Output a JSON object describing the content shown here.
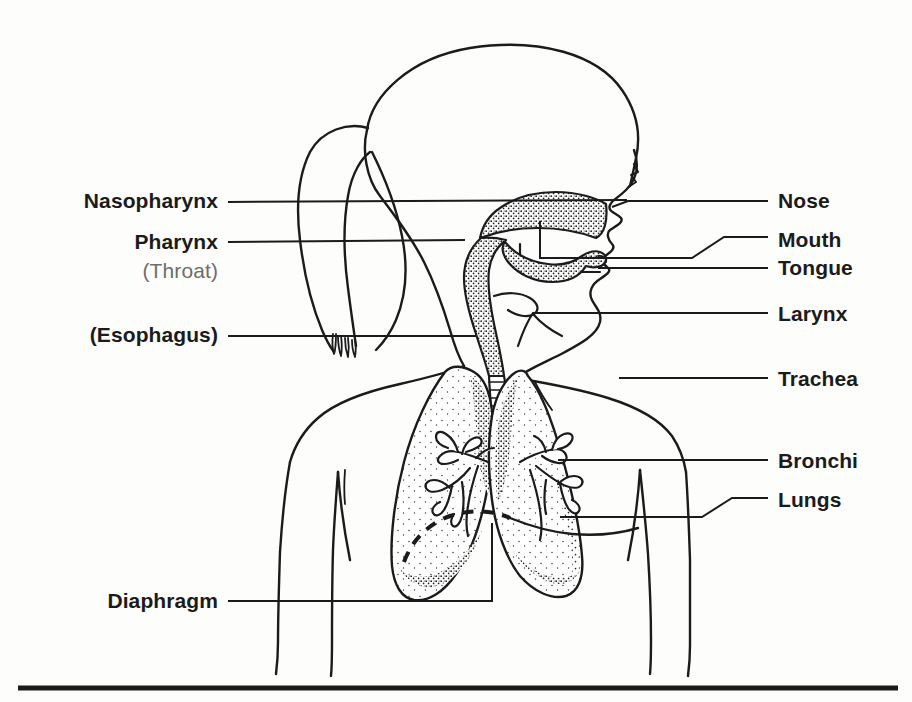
{
  "figure": {
    "ink_color": "#1b1b1b",
    "background_color": "#fdfdfc",
    "sub_label_color": "#6d6d6d",
    "rule_color": "#1b1b1b"
  },
  "labels": {
    "left": [
      {
        "id": "nasopharynx",
        "text": "Nasopharynx",
        "x": 218,
        "y": 202,
        "align": "right",
        "style": "bold"
      },
      {
        "id": "pharynx",
        "text": "Pharynx",
        "x": 218,
        "y": 243,
        "align": "right",
        "style": "bold"
      },
      {
        "id": "throat",
        "text": "(Throat)",
        "x": 218,
        "y": 272,
        "align": "right",
        "style": "regular"
      },
      {
        "id": "esophagus",
        "text": "(Esophagus)",
        "x": 218,
        "y": 336,
        "align": "right",
        "style": "bold"
      },
      {
        "id": "diaphragm",
        "text": "Diaphragm",
        "x": 218,
        "y": 602,
        "align": "right",
        "style": "bold"
      }
    ],
    "right": [
      {
        "id": "nose",
        "text": "Nose",
        "x": 778,
        "y": 202,
        "align": "left",
        "style": "bold"
      },
      {
        "id": "mouth",
        "text": "Mouth",
        "x": 778,
        "y": 241,
        "align": "left",
        "style": "bold"
      },
      {
        "id": "tongue",
        "text": "Tongue",
        "x": 778,
        "y": 269,
        "align": "left",
        "style": "bold"
      },
      {
        "id": "larynx",
        "text": "Larynx",
        "x": 778,
        "y": 315,
        "align": "left",
        "style": "bold"
      },
      {
        "id": "trachea",
        "text": "Trachea",
        "x": 778,
        "y": 380,
        "align": "left",
        "style": "bold"
      },
      {
        "id": "bronchi",
        "text": "Bronchi",
        "x": 778,
        "y": 462,
        "align": "left",
        "style": "bold"
      },
      {
        "id": "lungs",
        "text": "Lungs",
        "x": 778,
        "y": 501,
        "align": "left",
        "style": "bold"
      }
    ]
  },
  "leaders": [
    {
      "id": "leader-nasopharynx",
      "from": "nasopharynx",
      "path": "M228,202 L627,200"
    },
    {
      "id": "leader-pharynx",
      "from": "pharynx",
      "path": "M228,242 L465,240"
    },
    {
      "id": "leader-esophagus",
      "from": "esophagus",
      "path": "M228,336 L476,336"
    },
    {
      "id": "leader-diaphragm",
      "from": "diaphragm",
      "path": "M228,601 L492,601 L492,523"
    },
    {
      "id": "leader-nose",
      "from": "nose",
      "path": "M768,200 L627,200 L612,205"
    },
    {
      "id": "leader-mouth",
      "from": "mouth",
      "path": "M768,238 L722,238 L690,258 L540,258 L540,220"
    },
    {
      "id": "leader-tongue",
      "from": "tongue",
      "path": "M768,268 L596,268"
    },
    {
      "id": "leader-larynx",
      "from": "larynx",
      "path": "M768,313 L533,313"
    },
    {
      "id": "leader-trachea",
      "from": "trachea",
      "path": "M768,378 L619,378"
    },
    {
      "id": "leader-bronchi",
      "from": "bronchi",
      "path": "M768,460 L560,460"
    },
    {
      "id": "leader-lungs",
      "from": "lungs",
      "path": "M768,498 L730,498 L700,517 L560,517"
    }
  ],
  "anatomy": {
    "parts": [
      "skull-outline",
      "face-profile",
      "ponytail-hair",
      "nasal-cavity-shaded",
      "oral-cavity",
      "tongue-shaded",
      "pharynx-passage",
      "larynx",
      "trachea-with-cartilage-rings",
      "left-lung-shaded",
      "right-lung-shaded",
      "bronchial-tree-left",
      "bronchial-tree-right",
      "diaphragm-dashed-line",
      "torso-outline",
      "shoulders-and-arms"
    ]
  },
  "footer_rule": {
    "id": "bottom-rule",
    "y": 688,
    "x_start": 18,
    "x_end": 898,
    "thickness": 5
  }
}
